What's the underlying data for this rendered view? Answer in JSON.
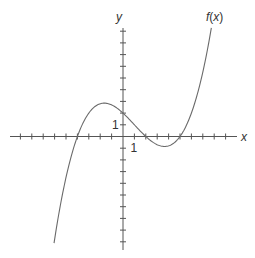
{
  "chart_data": {
    "type": "line",
    "title": "",
    "xlabel": "x",
    "ylabel": "y",
    "function_label": "f(x)",
    "function_label_parts": {
      "name": "f",
      "open": "(",
      "var": "x",
      "close": ")"
    },
    "xlim": [
      -10,
      9
    ],
    "ylim": [
      -9,
      9
    ],
    "grid": false,
    "legend": "none",
    "x_tick_step": 1,
    "y_tick_step": 1,
    "labeled_ticks": {
      "x": "1",
      "y": "1"
    },
    "series": [
      {
        "name": "f(x)",
        "description": "cubic with roots at x = -4, 2, 5; y-intercept 2; local max ≈ (-1.5, 2.8); local min ≈ (3.7, -0.85)",
        "formula": "0.05*(x+4)*(x-2)*(x-5)",
        "coefficient": 0.05,
        "roots": [
          -4,
          2,
          5
        ],
        "x_range": [
          -6.05,
          7.75
        ],
        "x": [
          -6,
          -5,
          -4,
          -3,
          -2,
          -1,
          0,
          1,
          2,
          3,
          4,
          5,
          6,
          7,
          7.7
        ],
        "y": [
          -8.8,
          -3.5,
          0,
          2.0,
          2.8,
          2.7,
          2.0,
          1.0,
          0,
          -0.7,
          -0.8,
          0,
          2.0,
          6.0,
          9.0
        ]
      }
    ]
  }
}
